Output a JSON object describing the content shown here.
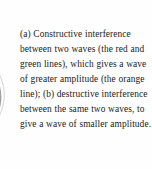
{
  "figure": {
    "background_color": "#fefefe",
    "text_color": "#1c1c1c",
    "caption": "(a) Constructive interference between two waves (the red and green lines), which gives a wave of greater amplitude (the orange line); (b) destructive interference between the same two waves, to give a wave of smaller amplitude.",
    "caption_lines": [
      "(a) Constructive",
      "interference between two",
      "waves (the red and green",
      "lines), which gives a wave",
      "of greater amplitude (the",
      "orange line); (b) destructive",
      "interference between the",
      "same two waves, to give a",
      "wave of smaller amplitude."
    ],
    "part_labels": [
      "(a)",
      "(b)"
    ],
    "referenced_colors": {
      "wave_one": "red",
      "wave_two": "green",
      "resultant_constructive": "orange"
    },
    "graphic": {
      "name": "wave-curve-fragment",
      "description": "partial gray curved wave line cropped at the left edge",
      "stroke_color": "#8a8a8a"
    }
  }
}
